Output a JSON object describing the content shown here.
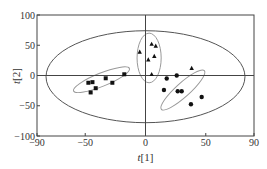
{
  "chart_data": {
    "type": "scatter",
    "title": "",
    "xlabel": "t[1]",
    "ylabel": "t[2]",
    "xlim": [
      -90,
      90
    ],
    "ylim": [
      -100,
      100
    ],
    "xticks": [
      -90,
      -50,
      0,
      50,
      90
    ],
    "yticks": [
      100,
      50,
      0,
      -50,
      -100
    ],
    "xtick_labels": [
      "−90",
      "−50",
      "0",
      "50",
      "90"
    ],
    "ytick_labels": [
      "100",
      "50",
      "0",
      "−50",
      "−100"
    ],
    "grid": false,
    "legend": null,
    "series": [
      {
        "name": "group-square",
        "marker": "square",
        "points": [
          [
            -17.6,
            2
          ],
          [
            -33,
            -4.6
          ],
          [
            -27.5,
            -12
          ],
          [
            -47.4,
            -12
          ],
          [
            -44,
            -11
          ],
          [
            -41.3,
            -21
          ],
          [
            -45.5,
            -28
          ]
        ]
      },
      {
        "name": "group-triangle",
        "marker": "triangle",
        "points": [
          [
            -4.8,
            39
          ],
          [
            5.1,
            52
          ],
          [
            8.5,
            49
          ],
          [
            2.3,
            26
          ],
          [
            7.3,
            32
          ],
          [
            5.1,
            2
          ],
          [
            38.3,
            12
          ]
        ]
      },
      {
        "name": "group-circle",
        "marker": "circle",
        "points": [
          [
            25.9,
            0
          ],
          [
            17.6,
            -5
          ],
          [
            15.3,
            -24
          ],
          [
            26.7,
            -26
          ],
          [
            30,
            -26
          ],
          [
            46.6,
            -35.5
          ],
          [
            37.7,
            -47.6
          ]
        ]
      }
    ],
    "ellipses": [
      {
        "name": "hotelling-t2-95",
        "cx": 0,
        "cy": -2,
        "rx": 82.5,
        "ry": 76,
        "rotate": 0,
        "stroke": "#555555"
      },
      {
        "name": "cluster-square",
        "cx": -36.5,
        "cy": -7,
        "rx": 25,
        "ry": 11,
        "rotate": -22,
        "stroke": "#999999"
      },
      {
        "name": "cluster-triangle",
        "cx": 3,
        "cy": 29,
        "rx": 10,
        "ry": 41,
        "rotate": 0,
        "stroke": "#999999"
      },
      {
        "name": "cluster-circle",
        "cx": 31,
        "cy": -24,
        "rx": 24,
        "ry": 11.5,
        "rotate": -42,
        "stroke": "#999999"
      }
    ],
    "colors": {
      "axis": "#444444",
      "markers": "#111111",
      "zero_lines": "#444444"
    }
  }
}
